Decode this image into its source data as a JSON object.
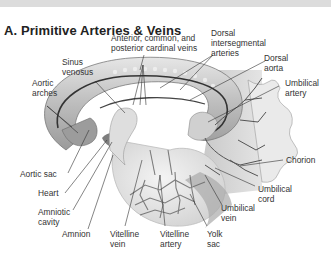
{
  "figure": {
    "title": "A.  Primitive Arteries & Veins",
    "labels": {
      "cardinal_veins_l1": "Anterior, common, and",
      "cardinal_veins_l2": "posterior cardinal veins",
      "dorsal_interseg_l1": "Dorsal",
      "dorsal_interseg_l2": "intersegmental",
      "dorsal_interseg_l3": "arteries",
      "dorsal_aorta_l1": "Dorsal",
      "dorsal_aorta_l2": "aorta",
      "sinus_venosus_l1": "Sinus",
      "sinus_venosus_l2": "venosus",
      "aortic_arches_l1": "Aortic",
      "aortic_arches_l2": "arches",
      "umbilical_artery_l1": "Umbilical",
      "umbilical_artery_l2": "artery",
      "chorion": "Chorion",
      "aortic_sac": "Aortic sac",
      "heart": "Heart",
      "umbilical_cord_l1": "Umbilical",
      "umbilical_cord_l2": "cord",
      "amniotic_cavity_l1": "Amniotic",
      "amniotic_cavity_l2": "cavity",
      "umbilical_vein_l1": "Umbilical",
      "umbilical_vein_l2": "vein",
      "amnion": "Amnion",
      "vitelline_vein_l1": "Vitelline",
      "vitelline_vein_l2": "vein",
      "vitelline_artery_l1": "Vitelline",
      "vitelline_artery_l2": "artery",
      "yolk_sac_l1": "Yolk",
      "yolk_sac_l2": "sac"
    },
    "colors": {
      "background": "#ffffff",
      "topbar": "#dcdcdc",
      "text": "#333333",
      "embryo_light": "#d8d8d8",
      "embryo_dark": "#8a8a8a",
      "vessel": "#555555",
      "chorion_bg": "#cfcfcf"
    }
  }
}
